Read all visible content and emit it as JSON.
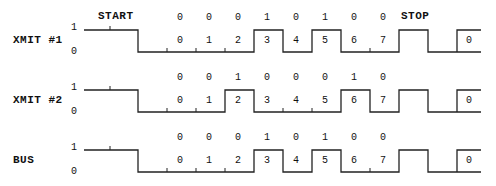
{
  "header": {
    "start_label": "START",
    "stop_label": "STOP"
  },
  "bit_indices": [
    "0",
    "1",
    "2",
    "3",
    "4",
    "5",
    "6",
    "7"
  ],
  "trailing_bit_index": "0",
  "level_labels": {
    "high": "1",
    "low": "0"
  },
  "rows": [
    {
      "label": "XMIT #1",
      "bits": [
        "0",
        "0",
        "0",
        "1",
        "0",
        "1",
        "0",
        "0"
      ]
    },
    {
      "label": "XMIT #2",
      "bits": [
        "0",
        "0",
        "1",
        "0",
        "0",
        "0",
        "1",
        "0"
      ]
    },
    {
      "label": "BUS",
      "bits": [
        "0",
        "0",
        "0",
        "1",
        "0",
        "1",
        "0",
        "0"
      ]
    }
  ]
}
